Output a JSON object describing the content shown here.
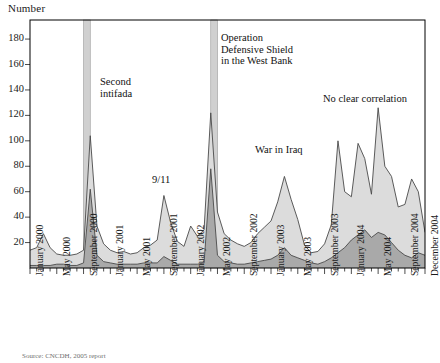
{
  "axis_title": "Number",
  "source_note": "Source: CNCDH, 2005 report",
  "colors": {
    "upper_area_fill": "#dcdcdc",
    "lower_area_fill": "#a9a9a9",
    "line": "#4a4a4a",
    "event_band": "#d0d0d0",
    "frame": "#000000",
    "text": "#111111"
  },
  "annotations": [
    {
      "id": "second-intifada",
      "text": "Second\nintifada"
    },
    {
      "id": "operation-defensive-shield",
      "text": "Operation\nDefensive Shield\nin the West Bank"
    },
    {
      "id": "nine-eleven",
      "text": "9/11"
    },
    {
      "id": "war-in-iraq",
      "text": "War in Iraq"
    },
    {
      "id": "no-clear-correlation",
      "text": "No clear correlation"
    }
  ],
  "event_bands": [
    {
      "id": "band-second-intifada",
      "start_index": 8,
      "end_index": 9
    },
    {
      "id": "band-defensive-shield",
      "start_index": 27,
      "end_index": 28
    }
  ],
  "chart_data": {
    "type": "area",
    "title": "",
    "xlabel": "",
    "ylabel": "Number",
    "ylim": [
      0,
      195
    ],
    "yticks": [
      20,
      40,
      60,
      80,
      100,
      120,
      140,
      160,
      180
    ],
    "grid": false,
    "legend": "none",
    "stacked": true,
    "x_tick_labels": [
      "January 2000",
      "May 2000",
      "September 2000",
      "January 2001",
      "May 2001",
      "September 2001",
      "January 2002",
      "May 2002",
      "September 2002",
      "January 2003",
      "May 2003",
      "September 2003",
      "January 2004",
      "May 2004",
      "September 2004",
      "December 2004"
    ],
    "x_tick_indices": [
      0,
      4,
      8,
      12,
      16,
      20,
      24,
      28,
      32,
      36,
      40,
      44,
      48,
      52,
      56,
      59
    ],
    "x": [
      "2000-01",
      "2000-02",
      "2000-03",
      "2000-04",
      "2000-05",
      "2000-06",
      "2000-07",
      "2000-08",
      "2000-09",
      "2000-10",
      "2000-11",
      "2000-12",
      "2001-01",
      "2001-02",
      "2001-03",
      "2001-04",
      "2001-05",
      "2001-06",
      "2001-07",
      "2001-08",
      "2001-09",
      "2001-10",
      "2001-11",
      "2001-12",
      "2002-01",
      "2002-02",
      "2002-03",
      "2002-04",
      "2002-05",
      "2002-06",
      "2002-07",
      "2002-08",
      "2002-09",
      "2002-10",
      "2002-11",
      "2002-12",
      "2003-01",
      "2003-02",
      "2003-03",
      "2003-04",
      "2003-05",
      "2003-06",
      "2003-07",
      "2003-08",
      "2003-09",
      "2003-10",
      "2003-11",
      "2003-12",
      "2004-01",
      "2004-02",
      "2004-03",
      "2004-04",
      "2004-05",
      "2004-06",
      "2004-07",
      "2004-08",
      "2004-09",
      "2004-10",
      "2004-11",
      "2004-12"
    ],
    "series": [
      {
        "name": "lower",
        "values": [
          2,
          2,
          2,
          2,
          3,
          3,
          2,
          2,
          4,
          62,
          10,
          5,
          4,
          3,
          3,
          3,
          3,
          4,
          4,
          4,
          9,
          6,
          3,
          3,
          3,
          3,
          4,
          78,
          10,
          5,
          4,
          3,
          3,
          4,
          5,
          6,
          7,
          10,
          16,
          10,
          8,
          6,
          4,
          3,
          5,
          8,
          12,
          16,
          22,
          26,
          30,
          24,
          28,
          26,
          20,
          14,
          10,
          8,
          12,
          10
        ]
      },
      {
        "name": "upper",
        "values": [
          12,
          14,
          25,
          14,
          8,
          7,
          8,
          9,
          10,
          42,
          23,
          14,
          10,
          9,
          10,
          8,
          9,
          12,
          14,
          18,
          48,
          30,
          18,
          14,
          30,
          22,
          26,
          44,
          34,
          22,
          18,
          16,
          14,
          16,
          22,
          26,
          30,
          42,
          56,
          44,
          30,
          12,
          8,
          10,
          14,
          26,
          88,
          44,
          34,
          72,
          56,
          34,
          98,
          54,
          52,
          34,
          40,
          62,
          48,
          18
        ]
      }
    ],
    "peaks": [
      {
        "label": "Second intifada peak",
        "x": "2000-10",
        "total": 104
      },
      {
        "label": "9/11 peak",
        "x": "2001-09",
        "total": 57
      },
      {
        "label": "Defensive Shield peak",
        "x": "2002-04",
        "total": 122
      },
      {
        "label": "War in Iraq peak",
        "x": "2003-03",
        "total": 72
      },
      {
        "label": "No clear correlation peak 1",
        "x": "2003-11",
        "total": 100
      },
      {
        "label": "No clear correlation peak 2",
        "x": "2004-02",
        "total": 98
      },
      {
        "label": "No clear correlation peak 3",
        "x": "2004-05",
        "total": 126
      }
    ]
  }
}
